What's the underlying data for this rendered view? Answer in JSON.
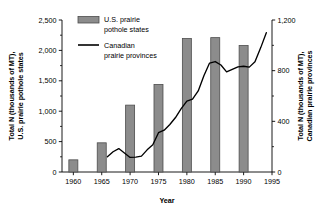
{
  "chart_data": {
    "type": "bar",
    "title": "",
    "xlabel": "Year",
    "ylabel": "Total N (thousands of MT), U.S. prairie pothole states",
    "y2label": "Total N (thousands of MT), Canadian prairie provinces",
    "xlim": [
      1958,
      1995
    ],
    "ylim": [
      0,
      2500
    ],
    "y2lim": [
      0,
      1200
    ],
    "grid": false,
    "legend_position": "top-left-inside",
    "x_ticks": [
      "1960",
      "1965",
      "1970",
      "1975",
      "1980",
      "1985",
      "1990",
      "1995"
    ],
    "x_tick_values": [
      1960,
      1965,
      1970,
      1975,
      1980,
      1985,
      1990,
      1995
    ],
    "y_ticks": [
      "0",
      "500",
      "1,000",
      "1,500",
      "2,000",
      "2,500"
    ],
    "y_tick_values": [
      0,
      500,
      1000,
      1500,
      2000,
      2500
    ],
    "y2_ticks": [
      "0",
      "400",
      "800",
      "1,200"
    ],
    "y2_tick_values": [
      0,
      400,
      800,
      1200
    ],
    "y2_minor_tick_values": [
      200,
      600,
      1000
    ],
    "series": [
      {
        "name": "U.S. prairie pothole states",
        "type": "bar",
        "axis": "left",
        "color": "#8c8c8c",
        "edge_color": "#4d4d4d",
        "categories": [
          1960,
          1965,
          1970,
          1975,
          1980,
          1985,
          1990
        ],
        "values": [
          200,
          480,
          1100,
          1440,
          2195,
          2210,
          2080
        ]
      },
      {
        "name": "Canadian prairie provinces",
        "type": "line",
        "axis": "right",
        "color": "#000000",
        "x": [
          1966,
          1967,
          1968,
          1969,
          1970,
          1971,
          1972,
          1973,
          1974,
          1975,
          1976,
          1977,
          1978,
          1979,
          1980,
          1981,
          1982,
          1983,
          1984,
          1985,
          1986,
          1987,
          1988,
          1989,
          1990,
          1991,
          1992,
          1993,
          1994
        ],
        "values": [
          120,
          160,
          185,
          150,
          115,
          118,
          125,
          175,
          215,
          310,
          330,
          375,
          430,
          500,
          560,
          575,
          640,
          760,
          860,
          872,
          845,
          790,
          810,
          830,
          835,
          828,
          870,
          980,
          1100
        ]
      }
    ],
    "legend": [
      {
        "label_line1": "U.S. prairie",
        "label_line2": "pothole states",
        "marker": "bar-swatch"
      },
      {
        "label_line1": "Canadian",
        "label_line2": "prairie provinces",
        "marker": "line-swatch"
      }
    ],
    "axis_titles": {
      "left_line1": "Total N (thousands of MT),",
      "left_line2": "U.S. prairie pothole states",
      "right_line1": "Total N (thousands of MT),",
      "right_line2": "Canadian prairie provinces"
    },
    "colors": {
      "bar_fill": "#8c8c8c",
      "bar_edge": "#4d4d4d",
      "line": "#000000",
      "axis": "#000000",
      "background": "#ffffff"
    }
  }
}
